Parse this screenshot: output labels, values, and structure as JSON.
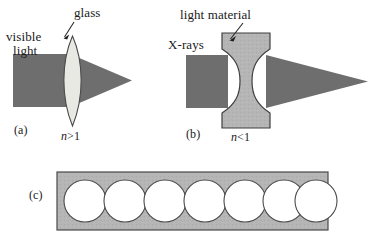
{
  "figure": {
    "type": "optics-diagram",
    "background_color": "#ffffff",
    "beam_color": "#6e6e6e",
    "glass_color": "#e6e6e2",
    "light_material_color": "#b5b5b5",
    "bar_color": "#b0b0b0",
    "outline_color": "#3a3a3a",
    "text_color": "#1a1a1a"
  },
  "panel_a": {
    "tag": "(a)",
    "source_label_line1": "visible",
    "source_label_line2": "light",
    "element_label": "glass",
    "index_label": "n>1",
    "index_symbol": "n",
    "index_relation": ">1",
    "lens_type": "biconvex",
    "beam_behavior": "converging"
  },
  "panel_b": {
    "tag": "(b)",
    "source_label": "X-rays",
    "element_label": "light material",
    "index_label": "n<1",
    "index_symbol": "n",
    "index_relation": "<1",
    "lens_type": "biconcave",
    "beam_behavior": "converging"
  },
  "panel_c": {
    "tag": "(c)",
    "description": "compound refractive lens: row of circular holes in a light-material bar",
    "hole_count": 7,
    "hole_shape": "circle"
  }
}
